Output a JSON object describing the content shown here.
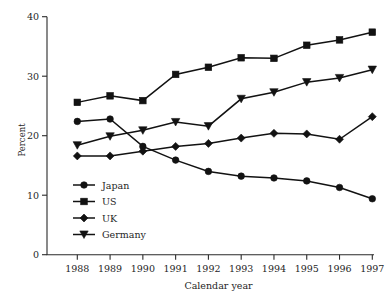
{
  "chart_data": {
    "type": "line",
    "title": "",
    "xlabel": "Calendar year",
    "ylabel": "Percent",
    "categories": [
      "1988",
      "1989",
      "1990",
      "1991",
      "1992",
      "1993",
      "1994",
      "1995",
      "1996",
      "1997"
    ],
    "x": [
      1988,
      1989,
      1990,
      1991,
      1992,
      1993,
      1994,
      1995,
      1996,
      1997
    ],
    "xlim": [
      1987.5,
      1997.5
    ],
    "ylim": [
      0,
      40
    ],
    "yticks": [
      0,
      10,
      20,
      30,
      40
    ],
    "xticks": [
      "1988",
      "1989",
      "1990",
      "1991",
      "1992",
      "1993",
      "1994",
      "1995",
      "1996",
      "1997"
    ],
    "grid": false,
    "legend_position": "inside lower-left",
    "series": [
      {
        "name": "Japan",
        "marker": "circle",
        "values": [
          22.4,
          22.8,
          18.2,
          15.9,
          14.0,
          13.2,
          12.9,
          12.4,
          11.3,
          9.4
        ]
      },
      {
        "name": "US",
        "marker": "square",
        "values": [
          25.6,
          26.7,
          25.9,
          30.3,
          31.5,
          33.1,
          33.0,
          35.2,
          36.1,
          37.4
        ]
      },
      {
        "name": "UK",
        "marker": "diamond",
        "values": [
          16.6,
          16.6,
          17.4,
          18.2,
          18.7,
          19.6,
          20.4,
          20.3,
          19.4,
          23.2
        ]
      },
      {
        "name": "Germany",
        "marker": "triangle-down",
        "values": [
          18.4,
          19.9,
          20.9,
          22.3,
          21.6,
          26.2,
          27.3,
          29.0,
          29.7,
          31.1
        ]
      }
    ]
  },
  "axis": {
    "ytick_labels": [
      "0",
      "10",
      "20",
      "30",
      "40"
    ],
    "xtick_labels": [
      "1988",
      "1989",
      "1990",
      "1991",
      "1992",
      "1993",
      "1994",
      "1995",
      "1996",
      "1997"
    ],
    "x_title": "Calendar year",
    "y_title": "Percent"
  },
  "legend": {
    "items": [
      {
        "label": "Japan",
        "marker": "circle"
      },
      {
        "label": "US",
        "marker": "square"
      },
      {
        "label": "UK",
        "marker": "diamond"
      },
      {
        "label": "Germany",
        "marker": "triangle-down"
      }
    ]
  }
}
